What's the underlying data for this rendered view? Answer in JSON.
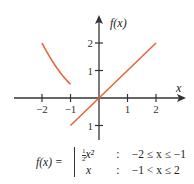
{
  "chart_data": {
    "type": "line",
    "title": "",
    "xlabel": "x",
    "ylabel": "f(x)",
    "xlim": [
      -3,
      3
    ],
    "ylim": [
      -1.5,
      2.8
    ],
    "x_ticks": [
      -2,
      -1,
      1,
      2
    ],
    "x_tick_labels": [
      "−2",
      "−1",
      "1",
      "2"
    ],
    "y_ticks": [
      2,
      1,
      -1
    ],
    "y_tick_labels": [
      "2",
      "1",
      "1"
    ],
    "grid": false,
    "series": [
      {
        "name": "(1/2)x^2 on -2 ≤ x ≤ -1",
        "color": "#e8663d",
        "x": [
          -2,
          -1.75,
          -1.5,
          -1.25,
          -1
        ],
        "y": [
          2,
          1.53,
          1.125,
          0.78,
          0.5
        ]
      },
      {
        "name": "x on -1 < x ≤ 2",
        "color": "#e8663d",
        "x": [
          -1,
          2
        ],
        "y": [
          -1,
          2
        ]
      }
    ],
    "annotation": "f(x) = { (1/2)x^2 : -2 ≤ x ≤ -1 ; x : -1 < x ≤ 2 }"
  },
  "formula": {
    "lhs": "f(x) =",
    "rows": [
      {
        "expr_num": "1",
        "expr_den": "2",
        "expr_var": "x²",
        "colon": ":",
        "cond": "−2 ≤ x ≤ −1"
      },
      {
        "expr": "x",
        "colon": ":",
        "cond": "−1 < x ≤ 2"
      }
    ]
  },
  "colors": {
    "curve": "#e8663d",
    "axis": "#333333"
  }
}
